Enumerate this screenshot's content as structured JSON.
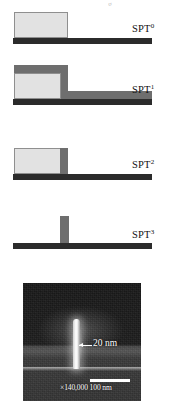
{
  "figure": {
    "top_cropped_text": "g",
    "stages": [
      {
        "id": "spt0",
        "label": "SPT",
        "exponent": "0",
        "description": "photoresist-line-on-substrate"
      },
      {
        "id": "spt1",
        "label": "SPT",
        "exponent": "1",
        "description": "conformal-film-deposition-over-resist"
      },
      {
        "id": "spt2",
        "label": "SPT",
        "exponent": "2",
        "description": "anisotropic-etchback-leaving-sidewall-spacer"
      },
      {
        "id": "spt3",
        "label": "SPT",
        "exponent": "3",
        "description": "core-removal-leaving-freestanding-spacer"
      }
    ],
    "colors": {
      "substrate": "#2b2b2b",
      "resist": "#e2e2e2",
      "resist_border": "#8f8f8f",
      "film": "#6e6e6e",
      "label_text": "#111111"
    },
    "sem": {
      "dimension_label": "20 nm",
      "magnification_and_scale": "×140,000  100 nm",
      "scalebar_length_label": "100 nm",
      "magnification_label": "×140,000"
    }
  }
}
